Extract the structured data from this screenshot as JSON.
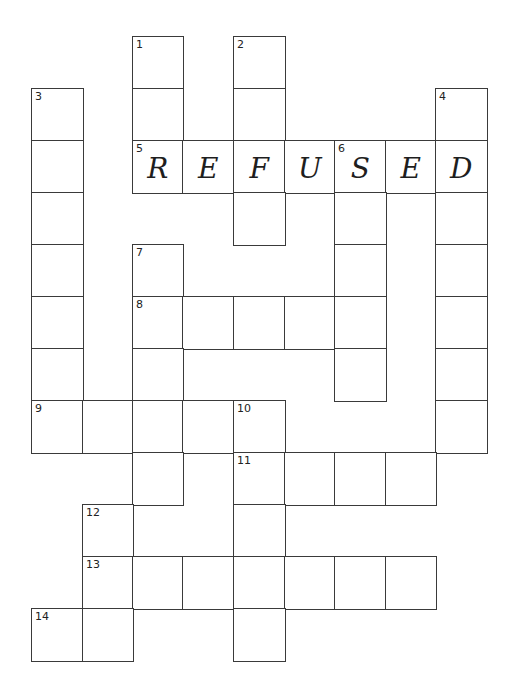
{
  "puzzle": {
    "type": "crossword",
    "grid_origin": {
      "x": 31,
      "y": 36
    },
    "cell_size": {
      "w": 50.6,
      "h": 52
    },
    "colors": {
      "border": "#3a3a3a",
      "background": "#ffffff",
      "text": "#1e1e1e"
    },
    "cells": [
      {
        "r": 0,
        "c": 2,
        "num": "1",
        "letter": ""
      },
      {
        "r": 0,
        "c": 4,
        "num": "2",
        "letter": ""
      },
      {
        "r": 1,
        "c": 0,
        "num": "3",
        "letter": ""
      },
      {
        "r": 1,
        "c": 2,
        "num": "",
        "letter": ""
      },
      {
        "r": 1,
        "c": 4,
        "num": "",
        "letter": ""
      },
      {
        "r": 1,
        "c": 8,
        "num": "4",
        "letter": ""
      },
      {
        "r": 2,
        "c": 0,
        "num": "",
        "letter": ""
      },
      {
        "r": 2,
        "c": 2,
        "num": "5",
        "letter": "R"
      },
      {
        "r": 2,
        "c": 3,
        "num": "",
        "letter": "E"
      },
      {
        "r": 2,
        "c": 4,
        "num": "",
        "letter": "F"
      },
      {
        "r": 2,
        "c": 5,
        "num": "",
        "letter": "U"
      },
      {
        "r": 2,
        "c": 6,
        "num": "6",
        "letter": "S"
      },
      {
        "r": 2,
        "c": 7,
        "num": "",
        "letter": "E"
      },
      {
        "r": 2,
        "c": 8,
        "num": "",
        "letter": "D"
      },
      {
        "r": 3,
        "c": 0,
        "num": "",
        "letter": ""
      },
      {
        "r": 3,
        "c": 4,
        "num": "",
        "letter": ""
      },
      {
        "r": 3,
        "c": 6,
        "num": "",
        "letter": ""
      },
      {
        "r": 3,
        "c": 8,
        "num": "",
        "letter": ""
      },
      {
        "r": 4,
        "c": 0,
        "num": "",
        "letter": ""
      },
      {
        "r": 4,
        "c": 2,
        "num": "7",
        "letter": ""
      },
      {
        "r": 4,
        "c": 6,
        "num": "",
        "letter": ""
      },
      {
        "r": 4,
        "c": 8,
        "num": "",
        "letter": ""
      },
      {
        "r": 5,
        "c": 0,
        "num": "",
        "letter": ""
      },
      {
        "r": 5,
        "c": 2,
        "num": "8",
        "letter": ""
      },
      {
        "r": 5,
        "c": 3,
        "num": "",
        "letter": ""
      },
      {
        "r": 5,
        "c": 4,
        "num": "",
        "letter": ""
      },
      {
        "r": 5,
        "c": 5,
        "num": "",
        "letter": ""
      },
      {
        "r": 5,
        "c": 6,
        "num": "",
        "letter": ""
      },
      {
        "r": 5,
        "c": 8,
        "num": "",
        "letter": ""
      },
      {
        "r": 6,
        "c": 0,
        "num": "",
        "letter": ""
      },
      {
        "r": 6,
        "c": 2,
        "num": "",
        "letter": ""
      },
      {
        "r": 6,
        "c": 6,
        "num": "",
        "letter": ""
      },
      {
        "r": 6,
        "c": 8,
        "num": "",
        "letter": ""
      },
      {
        "r": 7,
        "c": 0,
        "num": "9",
        "letter": ""
      },
      {
        "r": 7,
        "c": 1,
        "num": "",
        "letter": ""
      },
      {
        "r": 7,
        "c": 2,
        "num": "",
        "letter": ""
      },
      {
        "r": 7,
        "c": 3,
        "num": "",
        "letter": ""
      },
      {
        "r": 7,
        "c": 4,
        "num": "10",
        "letter": ""
      },
      {
        "r": 7,
        "c": 8,
        "num": "",
        "letter": ""
      },
      {
        "r": 8,
        "c": 2,
        "num": "",
        "letter": ""
      },
      {
        "r": 8,
        "c": 4,
        "num": "11",
        "letter": ""
      },
      {
        "r": 8,
        "c": 5,
        "num": "",
        "letter": ""
      },
      {
        "r": 8,
        "c": 6,
        "num": "",
        "letter": ""
      },
      {
        "r": 8,
        "c": 7,
        "num": "",
        "letter": ""
      },
      {
        "r": 9,
        "c": 1,
        "num": "12",
        "letter": ""
      },
      {
        "r": 9,
        "c": 4,
        "num": "",
        "letter": ""
      },
      {
        "r": 10,
        "c": 1,
        "num": "13",
        "letter": ""
      },
      {
        "r": 10,
        "c": 2,
        "num": "",
        "letter": ""
      },
      {
        "r": 10,
        "c": 3,
        "num": "",
        "letter": ""
      },
      {
        "r": 10,
        "c": 4,
        "num": "",
        "letter": ""
      },
      {
        "r": 10,
        "c": 5,
        "num": "",
        "letter": ""
      },
      {
        "r": 10,
        "c": 6,
        "num": "",
        "letter": ""
      },
      {
        "r": 10,
        "c": 7,
        "num": "",
        "letter": ""
      },
      {
        "r": 11,
        "c": 0,
        "num": "14",
        "letter": ""
      },
      {
        "r": 11,
        "c": 1,
        "num": "",
        "letter": ""
      },
      {
        "r": 11,
        "c": 4,
        "num": "",
        "letter": ""
      }
    ],
    "filled_word": {
      "clue_number": "5",
      "direction": "across",
      "answer": "REFUSED"
    }
  }
}
